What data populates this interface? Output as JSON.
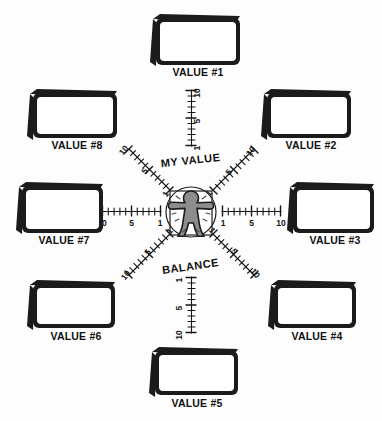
{
  "diagram": {
    "center": {
      "icon": "person-figure-icon",
      "shape": "circle-in-square"
    },
    "axis_titles": {
      "top": "MY VALUE",
      "bottom": "BALANCE"
    },
    "scale": {
      "labels": [
        "1",
        "5",
        "10"
      ],
      "inner": "1",
      "middle": "5",
      "outer": "10",
      "tick_count": 10
    },
    "colors": {
      "ink": "#1b1b1b",
      "figure_fill": "#8d8d8d",
      "paper": "#fdfdfd"
    },
    "boxes": [
      {
        "id": "value-1",
        "label": "VALUE #1",
        "value": "",
        "direction": "N"
      },
      {
        "id": "value-2",
        "label": "VALUE #2",
        "value": "",
        "direction": "NE"
      },
      {
        "id": "value-3",
        "label": "VALUE #3",
        "value": "",
        "direction": "E"
      },
      {
        "id": "value-4",
        "label": "VALUE #4",
        "value": "",
        "direction": "SE"
      },
      {
        "id": "value-5",
        "label": "VALUE #5",
        "value": "",
        "direction": "S"
      },
      {
        "id": "value-6",
        "label": "VALUE #6",
        "value": "",
        "direction": "SW"
      },
      {
        "id": "value-7",
        "label": "VALUE #7",
        "value": "",
        "direction": "W"
      },
      {
        "id": "value-8",
        "label": "VALUE #8",
        "value": "",
        "direction": "NW"
      }
    ],
    "axes": [
      {
        "id": "axis-n",
        "direction": "N",
        "ticks": [
          "10",
          "5",
          "1"
        ]
      },
      {
        "id": "axis-ne",
        "direction": "NE",
        "ticks": [
          "1",
          "5",
          "10"
        ]
      },
      {
        "id": "axis-e",
        "direction": "E",
        "ticks": [
          "1",
          "5",
          "10"
        ]
      },
      {
        "id": "axis-se",
        "direction": "SE",
        "ticks": [
          "1",
          "5",
          "10"
        ]
      },
      {
        "id": "axis-s",
        "direction": "S",
        "ticks": [
          "1",
          "5",
          "10"
        ]
      },
      {
        "id": "axis-sw",
        "direction": "SW",
        "ticks": [
          "1",
          "5",
          "10"
        ]
      },
      {
        "id": "axis-w",
        "direction": "W",
        "ticks": [
          "10",
          "5",
          "1"
        ]
      },
      {
        "id": "axis-nw",
        "direction": "NW",
        "ticks": [
          "10",
          "5",
          "1"
        ]
      }
    ]
  }
}
